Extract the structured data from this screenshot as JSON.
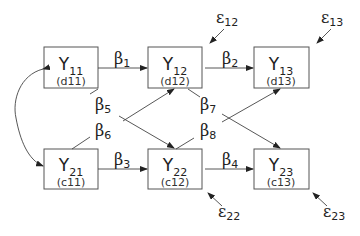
{
  "diagram": {
    "type": "path-diagram",
    "nodes": [
      {
        "id": "Y11",
        "symbol": "Y",
        "sub": "11",
        "code": "(d11)",
        "x": 44,
        "y": 47
      },
      {
        "id": "Y12",
        "symbol": "Y",
        "sub": "12",
        "code": "(d12)",
        "x": 148,
        "y": 47
      },
      {
        "id": "Y13",
        "symbol": "Y",
        "sub": "13",
        "code": "(d13)",
        "x": 254,
        "y": 47
      },
      {
        "id": "Y21",
        "symbol": "Y",
        "sub": "21",
        "code": "(c11)",
        "x": 44,
        "y": 149
      },
      {
        "id": "Y22",
        "symbol": "Y",
        "sub": "22",
        "code": "(c12)",
        "x": 148,
        "y": 149
      },
      {
        "id": "Y23",
        "symbol": "Y",
        "sub": "23",
        "code": "(c13)",
        "x": 254,
        "y": 149
      }
    ],
    "coefficients": [
      {
        "id": "b1",
        "symbol": "β",
        "sub": "1",
        "from": "Y11",
        "to": "Y12"
      },
      {
        "id": "b2",
        "symbol": "β",
        "sub": "2",
        "from": "Y12",
        "to": "Y13"
      },
      {
        "id": "b3",
        "symbol": "β",
        "sub": "3",
        "from": "Y21",
        "to": "Y22"
      },
      {
        "id": "b4",
        "symbol": "β",
        "sub": "4",
        "from": "Y22",
        "to": "Y23"
      },
      {
        "id": "b5",
        "symbol": "β",
        "sub": "5",
        "from": "Y11",
        "to": "Y22"
      },
      {
        "id": "b6",
        "symbol": "β",
        "sub": "6",
        "from": "Y21",
        "to": "Y12"
      },
      {
        "id": "b7",
        "symbol": "β",
        "sub": "7",
        "from": "Y12",
        "to": "Y23"
      },
      {
        "id": "b8",
        "symbol": "β",
        "sub": "8",
        "from": "Y22",
        "to": "Y13"
      }
    ],
    "errors": [
      {
        "id": "e12",
        "symbol": "ε",
        "sub": "12",
        "target": "Y12"
      },
      {
        "id": "e13",
        "symbol": "ε",
        "sub": "13",
        "target": "Y13"
      },
      {
        "id": "e22",
        "symbol": "ε",
        "sub": "22",
        "target": "Y22"
      },
      {
        "id": "e23",
        "symbol": "ε",
        "sub": "23",
        "target": "Y23"
      }
    ],
    "correlation": {
      "between": [
        "Y11",
        "Y21"
      ],
      "style": "curved-double-arrow"
    }
  }
}
